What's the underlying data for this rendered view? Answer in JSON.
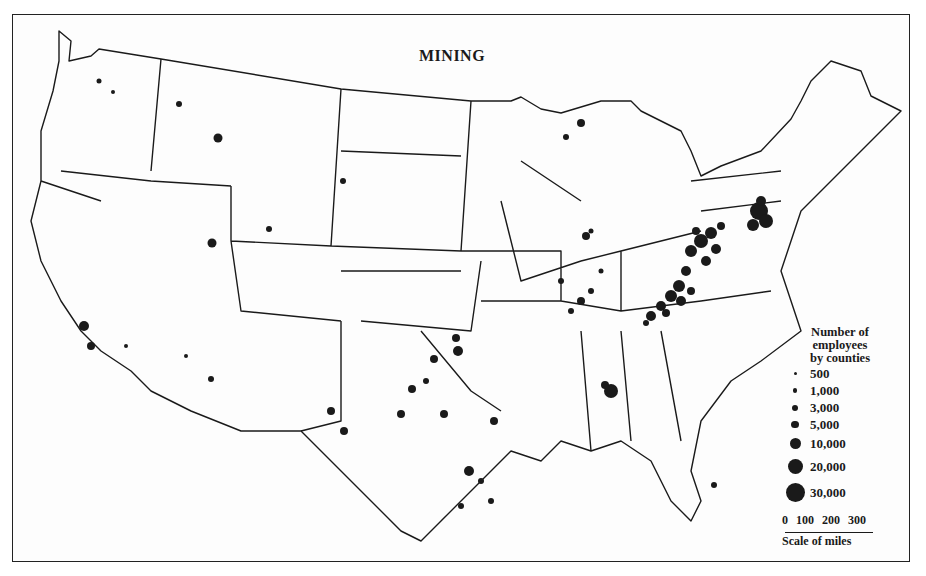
{
  "map": {
    "title": "MINING",
    "region": "United States (conterminous)",
    "legend": {
      "heading_lines": [
        "Number of",
        "employees",
        "by counties"
      ],
      "entries": [
        {
          "label": "500",
          "size": 3
        },
        {
          "label": "1,000",
          "size": 4.5
        },
        {
          "label": "3,000",
          "size": 6
        },
        {
          "label": "5,000",
          "size": 7.5
        },
        {
          "label": "10,000",
          "size": 10
        },
        {
          "label": "20,000",
          "size": 14
        },
        {
          "label": "30,000",
          "size": 18
        }
      ]
    },
    "scale": {
      "ticks": [
        "0",
        "100",
        "200",
        "300"
      ],
      "label": "Scale of miles"
    },
    "colors": {
      "ink": "#1a1a1a",
      "paper": "#fdfdfd"
    }
  }
}
